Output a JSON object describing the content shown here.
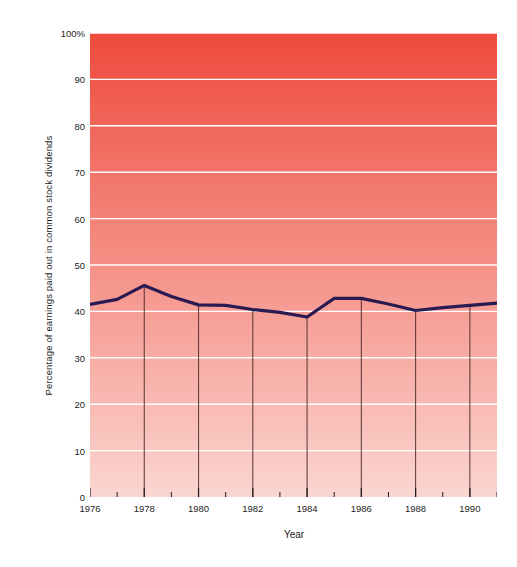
{
  "chart_data": {
    "type": "area",
    "title": "",
    "xlabel": "Year",
    "ylabel": "Percentage of earnings paid out in common stock dividends",
    "x": [
      1976,
      1977,
      1978,
      1979,
      1980,
      1981,
      1982,
      1983,
      1984,
      1985,
      1986,
      1987,
      1988,
      1989,
      1990,
      1991
    ],
    "values": [
      41.5,
      42.6,
      45.6,
      43.2,
      41.4,
      41.3,
      40.4,
      39.8,
      38.8,
      42.8,
      42.8,
      41.6,
      40.2,
      40.8,
      41.3,
      41.8
    ],
    "series": [
      {
        "name": "Percentage of earnings paid out in common stock dividends",
        "values": [
          41.5,
          42.6,
          45.6,
          43.2,
          41.4,
          41.3,
          40.4,
          39.8,
          38.8,
          42.8,
          42.8,
          41.6,
          40.2,
          40.8,
          41.3,
          41.8
        ]
      }
    ],
    "xlim": [
      1976,
      1991
    ],
    "ylim": [
      0,
      100
    ],
    "yticks": [
      0,
      10,
      20,
      30,
      40,
      50,
      60,
      70,
      80,
      90,
      100
    ],
    "ytick_labels": [
      "0",
      "10",
      "20",
      "30",
      "40",
      "50",
      "60",
      "70",
      "80",
      "90",
      "100%"
    ],
    "xticks_major": [
      1976,
      1978,
      1980,
      1982,
      1984,
      1986,
      1988,
      1990
    ],
    "xtick_labels": [
      "1976",
      "1978",
      "1980",
      "1982",
      "1984",
      "1986",
      "1988",
      "1990"
    ],
    "xticks_minor": [
      1977,
      1979,
      1981,
      1983,
      1985,
      1987,
      1989,
      1991
    ],
    "drop_line_years": [
      1978,
      1980,
      1982,
      1984,
      1986,
      1988,
      1990
    ],
    "grid": "horizontal",
    "legend": "none",
    "colors": {
      "line": "#2a1a52",
      "gridline": "#ffffff",
      "drop_line": "#4a2c2a",
      "background_top": "#ee4a3c",
      "background_bottom": "#fbd6d1",
      "axis_text": "#1d1d1d",
      "page_background": "#ffffff"
    }
  }
}
